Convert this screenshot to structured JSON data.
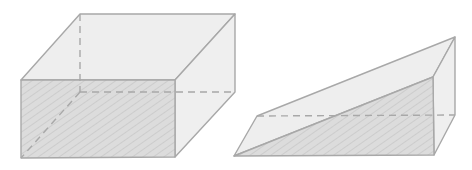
{
  "figure": {
    "colors": {
      "background": "#ffffff",
      "edge": "#a8a8a8",
      "face": "#ececec",
      "shaded_face": "#dcdcdc",
      "hatch": "#c4c4c4",
      "hidden_edge": "#a8a8a8"
    },
    "solids": [
      {
        "name": "rectangular-prism",
        "shaded_face": "front"
      },
      {
        "name": "triangular-prism",
        "shaded_face": "sloped-side"
      }
    ]
  }
}
